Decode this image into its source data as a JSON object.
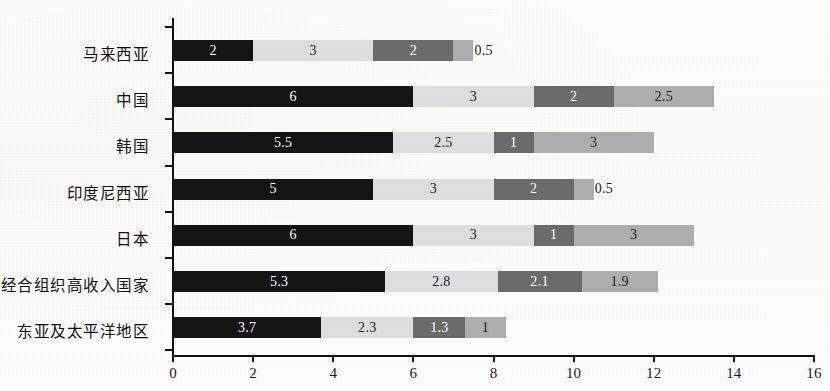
{
  "chart_data": {
    "type": "bar",
    "orientation": "horizontal",
    "stacked": true,
    "title": "",
    "subtitle": "",
    "xlabel": "",
    "ylabel": "",
    "xlim": [
      0,
      16
    ],
    "ylim": null,
    "grid": false,
    "legend": null,
    "legend_position": "none",
    "xticks": [
      0,
      2,
      4,
      6,
      8,
      10,
      12,
      14,
      16
    ],
    "xtick_labels": [
      "0",
      "2",
      "4",
      "6",
      "8",
      "10",
      "12",
      "14",
      "16"
    ],
    "categories": [
      "马来西亚",
      "中国",
      "韩国",
      "印度尼西亚",
      "日本",
      "经合组织高收入国家",
      "东亚及太平洋地区"
    ],
    "series": [
      {
        "name": "series-1",
        "color": "#141414",
        "values": [
          2,
          6,
          5.5,
          5,
          6,
          5.3,
          3.7
        ]
      },
      {
        "name": "series-2",
        "color": "#dedede",
        "values": [
          3,
          3,
          2.5,
          3,
          3,
          2.8,
          2.3
        ]
      },
      {
        "name": "series-3",
        "color": "#6b6b6b",
        "values": [
          2,
          2,
          1,
          2,
          1,
          2.1,
          1.3
        ]
      },
      {
        "name": "series-4",
        "color": "#aeaeae",
        "values": [
          0.5,
          2.5,
          3,
          0.5,
          3,
          1.9,
          1
        ]
      }
    ],
    "data_labels": [
      [
        "2",
        "3",
        "2",
        "0.5"
      ],
      [
        "6",
        "3",
        "2",
        "2.5"
      ],
      [
        "5.5",
        "2.5",
        "1",
        "3"
      ],
      [
        "5",
        "3",
        "2",
        "0.5"
      ],
      [
        "6",
        "3",
        "1",
        "3"
      ],
      [
        "5.3",
        "2.8",
        "2.1",
        "1.9"
      ],
      [
        "3.7",
        "2.3",
        "1.3",
        "1"
      ]
    ],
    "totals": [
      7.5,
      13.5,
      12,
      10.5,
      13,
      12.1,
      8.3
    ]
  },
  "colors": {
    "series_1": "#141414",
    "series_2": "#dedede",
    "series_3": "#6b6b6b",
    "series_4": "#aeaeae",
    "axis": "#111111",
    "background": "#ffffff"
  }
}
